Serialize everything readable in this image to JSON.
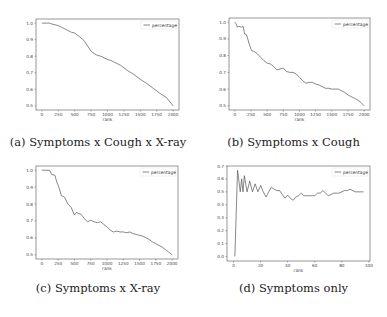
{
  "chart_data": [
    {
      "id": "a",
      "type": "line",
      "caption": "(a) Symptoms x Cough x X-ray",
      "title": "",
      "xlabel": "rank",
      "ylabel": "",
      "legend": [
        "percentage"
      ],
      "legend_position": "upper right",
      "grid": false,
      "xlim": [
        -90,
        2090
      ],
      "ylim": [
        0.475,
        1.025
      ],
      "xticks": [
        0,
        250,
        500,
        750,
        1000,
        1250,
        1500,
        1750,
        2000
      ],
      "yticks": [
        0.5,
        0.6,
        0.7,
        0.8,
        0.9,
        1.0
      ],
      "frame": {
        "left": 36,
        "top": 19,
        "right": 179,
        "bottom": 110
      },
      "series": [
        {
          "name": "percentage",
          "x": [
            0,
            120,
            150,
            200,
            250,
            300,
            350,
            400,
            450,
            500,
            550,
            600,
            650,
            700,
            750,
            800,
            850,
            900,
            950,
            1000,
            1050,
            1100,
            1150,
            1200,
            1250,
            1300,
            1400,
            1500,
            1600,
            1700,
            1800,
            1900,
            2000
          ],
          "values": [
            1.0,
            1.0,
            0.995,
            0.99,
            0.985,
            0.975,
            0.965,
            0.955,
            0.945,
            0.94,
            0.925,
            0.91,
            0.89,
            0.86,
            0.83,
            0.815,
            0.805,
            0.8,
            0.79,
            0.78,
            0.775,
            0.765,
            0.755,
            0.745,
            0.73,
            0.715,
            0.69,
            0.66,
            0.635,
            0.605,
            0.575,
            0.55,
            0.5
          ]
        }
      ]
    },
    {
      "id": "b",
      "type": "line",
      "caption": "(b) Symptoms x Cough",
      "title": "",
      "xlabel": "rank",
      "ylabel": "",
      "legend": [
        "percentage"
      ],
      "legend_position": "upper right",
      "grid": false,
      "xlim": [
        -90,
        2090
      ],
      "ylim": [
        0.475,
        1.025
      ],
      "xticks": [
        0,
        250,
        500,
        750,
        1000,
        1250,
        1500,
        1750,
        2000
      ],
      "yticks": [
        0.5,
        0.6,
        0.7,
        0.8,
        0.9,
        1.0
      ],
      "frame": {
        "left": 229,
        "top": 18,
        "right": 370,
        "bottom": 110
      },
      "series": [
        {
          "name": "percentage",
          "x": [
            0,
            20,
            40,
            60,
            100,
            130,
            150,
            180,
            200,
            230,
            260,
            300,
            350,
            400,
            450,
            500,
            550,
            600,
            650,
            700,
            750,
            800,
            850,
            900,
            950,
            1000,
            1050,
            1100,
            1150,
            1200,
            1250,
            1300,
            1350,
            1400,
            1450,
            1500,
            1550,
            1600,
            1650,
            1700,
            1750,
            1800,
            1850,
            1900,
            1950,
            2000
          ],
          "values": [
            1.0,
            0.99,
            0.97,
            0.975,
            0.97,
            0.975,
            0.93,
            0.925,
            0.9,
            0.86,
            0.83,
            0.825,
            0.81,
            0.79,
            0.77,
            0.755,
            0.75,
            0.735,
            0.715,
            0.72,
            0.725,
            0.705,
            0.7,
            0.7,
            0.69,
            0.67,
            0.65,
            0.635,
            0.64,
            0.64,
            0.63,
            0.625,
            0.615,
            0.605,
            0.605,
            0.6,
            0.6,
            0.6,
            0.59,
            0.58,
            0.565,
            0.555,
            0.545,
            0.535,
            0.52,
            0.5
          ]
        }
      ]
    },
    {
      "id": "c",
      "type": "line",
      "caption": "(c) Symptoms x X-ray",
      "title": "",
      "xlabel": "rank",
      "ylabel": "",
      "legend": [
        "percentage"
      ],
      "legend_position": "upper right",
      "grid": false,
      "xlim": [
        -90,
        2090
      ],
      "ylim": [
        0.475,
        1.025
      ],
      "xticks": [
        0,
        250,
        500,
        750,
        1000,
        1250,
        1500,
        1750,
        2000
      ],
      "yticks": [
        0.5,
        0.6,
        0.7,
        0.8,
        0.9,
        1.0
      ],
      "frame": {
        "left": 36,
        "top": 166,
        "right": 178,
        "bottom": 259
      },
      "series": [
        {
          "name": "percentage",
          "x": [
            0,
            120,
            150,
            200,
            230,
            260,
            300,
            350,
            400,
            450,
            500,
            530,
            560,
            600,
            650,
            700,
            750,
            800,
            850,
            900,
            950,
            1000,
            1050,
            1100,
            1150,
            1200,
            1250,
            1300,
            1350,
            1400,
            1450,
            1500,
            1550,
            1600,
            1650,
            1700,
            1750,
            1800,
            1850,
            1900,
            1950,
            2000
          ],
          "values": [
            1.0,
            1.0,
            0.975,
            0.97,
            0.93,
            0.9,
            0.85,
            0.84,
            0.8,
            0.78,
            0.735,
            0.75,
            0.745,
            0.74,
            0.715,
            0.695,
            0.705,
            0.695,
            0.69,
            0.695,
            0.68,
            0.665,
            0.645,
            0.635,
            0.64,
            0.635,
            0.635,
            0.63,
            0.635,
            0.625,
            0.62,
            0.615,
            0.61,
            0.6,
            0.59,
            0.575,
            0.565,
            0.555,
            0.545,
            0.53,
            0.515,
            0.5
          ]
        }
      ]
    },
    {
      "id": "d",
      "type": "line",
      "caption": "(d) Symptoms only",
      "title": "",
      "xlabel": "rank",
      "ylabel": "",
      "legend": [
        "percentage"
      ],
      "legend_position": "upper right",
      "grid": false,
      "xlim": [
        -4.8,
        100.8
      ],
      "ylim": [
        -0.035,
        0.7
      ],
      "xticks": [
        0,
        20,
        40,
        60,
        80,
        100
      ],
      "yticks": [
        0.0,
        0.1,
        0.2,
        0.3,
        0.4,
        0.5,
        0.6,
        0.7
      ],
      "frame": {
        "left": 227,
        "top": 166,
        "right": 370,
        "bottom": 261
      },
      "series": [
        {
          "name": "percentage",
          "x": [
            1,
            3,
            5,
            6,
            7,
            8,
            10,
            12,
            14,
            16,
            18,
            20,
            22,
            24,
            26,
            28,
            30,
            32,
            34,
            36,
            38,
            40,
            42,
            44,
            46,
            48,
            50,
            52,
            54,
            56,
            58,
            60,
            62,
            64,
            66,
            68,
            70,
            72,
            74,
            76,
            78,
            80,
            82,
            84,
            86,
            88,
            90,
            92,
            94,
            96
          ],
          "values": [
            0.0,
            0.667,
            0.5,
            0.6,
            0.5,
            0.625,
            0.5,
            0.583,
            0.5,
            0.562,
            0.5,
            0.55,
            0.5,
            0.46,
            0.5,
            0.536,
            0.52,
            0.51,
            0.51,
            0.48,
            0.45,
            0.475,
            0.45,
            0.435,
            0.46,
            0.47,
            0.49,
            0.47,
            0.47,
            0.47,
            0.47,
            0.47,
            0.49,
            0.49,
            0.51,
            0.49,
            0.47,
            0.48,
            0.49,
            0.49,
            0.49,
            0.5,
            0.51,
            0.51,
            0.52,
            0.51,
            0.5,
            0.5,
            0.5,
            0.5
          ]
        }
      ]
    }
  ],
  "captions": {
    "a": "(a) Symptoms x Cough x X-ray",
    "b": "(b) Symptoms x Cough",
    "c": "(c) Symptoms x X-ray",
    "d": "(d) Symptoms only"
  },
  "legend_label": "percentage",
  "xlabel": "rank",
  "colors": {
    "line": "#555555",
    "frame": "#333333",
    "text": "#444444"
  }
}
